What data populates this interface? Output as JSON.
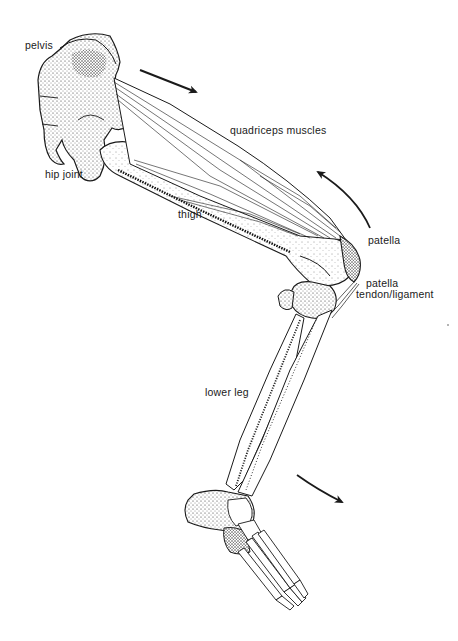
{
  "diagram": {
    "colors": {
      "ink": "#1a1a1a",
      "stipple": "#2a2a2a",
      "background": "#ffffff"
    },
    "labels": {
      "pelvis": "pelvis",
      "hip_joint": "hip joint",
      "quadriceps": "quadriceps muscles",
      "thigh": "thigh",
      "patella": "patella",
      "patella_tendon_line1": "patella",
      "patella_tendon_line2": "tendon/ligament",
      "lower_leg": "lower leg"
    },
    "arrows": [
      {
        "name": "quadriceps-pull-arrow",
        "direction": "down-right"
      },
      {
        "name": "knee-pull-arrow",
        "direction": "up-left"
      },
      {
        "name": "lower-leg-swing-arrow",
        "direction": "down-right"
      }
    ]
  }
}
